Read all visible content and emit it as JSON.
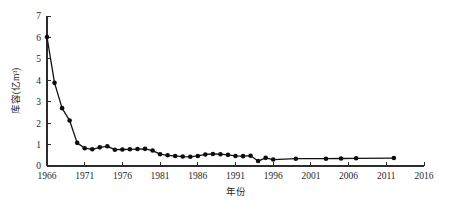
{
  "chart_data": {
    "type": "line",
    "title": "",
    "xlabel": "年份",
    "ylabel": "库容(亿m³)",
    "xlim": [
      1966,
      2016
    ],
    "ylim": [
      0,
      7
    ],
    "grid": false,
    "legend": null,
    "x_ticks": [
      "1966",
      "1971",
      "1976",
      "1981",
      "1986",
      "1991",
      "1996",
      "2001",
      "2006",
      "2011",
      "2016"
    ],
    "y_ticks": [
      "0",
      "1",
      "2",
      "3",
      "4",
      "5",
      "6",
      "7"
    ],
    "marker": "filled-circle",
    "line_color": "#111111",
    "marker_color": "#0d0d0d",
    "series": [
      {
        "name": "库容",
        "x": [
          1966,
          1967,
          1968,
          1969,
          1970,
          1971,
          1972,
          1973,
          1974,
          1975,
          1976,
          1977,
          1978,
          1979,
          1980,
          1981,
          1982,
          1983,
          1984,
          1985,
          1986,
          1987,
          1988,
          1989,
          1990,
          1991,
          1992,
          1993,
          1994,
          1995,
          1996,
          1999,
          2003,
          2005,
          2007,
          2012
        ],
        "values": [
          6.02,
          3.88,
          2.7,
          2.12,
          1.08,
          0.83,
          0.78,
          0.87,
          0.92,
          0.76,
          0.77,
          0.78,
          0.79,
          0.8,
          0.72,
          0.55,
          0.5,
          0.47,
          0.44,
          0.43,
          0.47,
          0.54,
          0.56,
          0.55,
          0.52,
          0.47,
          0.46,
          0.48,
          0.23,
          0.38,
          0.3,
          0.34,
          0.34,
          0.35,
          0.36,
          0.37
        ]
      }
    ]
  }
}
